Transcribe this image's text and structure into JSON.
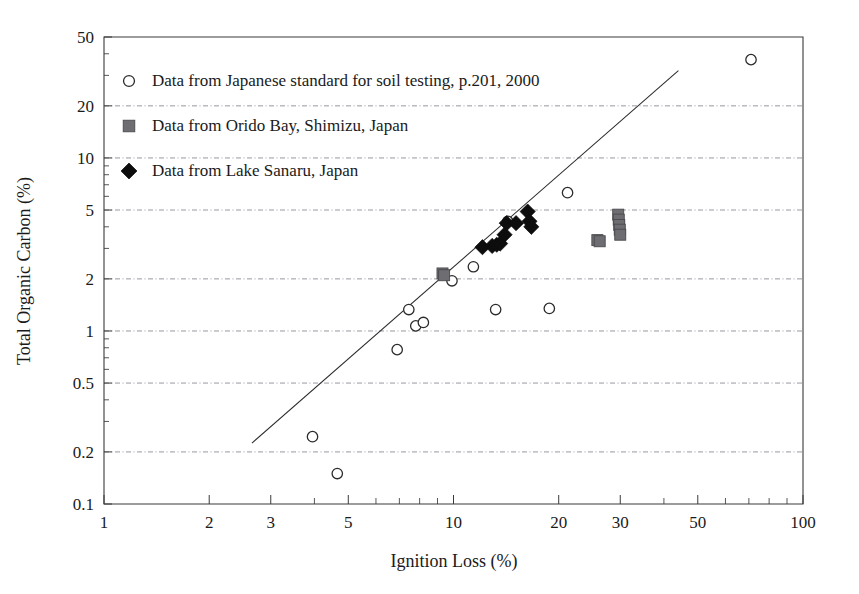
{
  "chart_data": {
    "type": "scatter",
    "title": "",
    "xlabel": "Ignition Loss (%)",
    "ylabel": "Total Organic Carbon (%)",
    "xscale": "log",
    "yscale": "log",
    "xlim": [
      1,
      100
    ],
    "ylim": [
      0.1,
      50
    ],
    "grid": true,
    "grid_axis": "y",
    "legend_position": "upper left",
    "xticks": [
      1,
      2,
      3,
      5,
      10,
      20,
      30,
      50,
      100
    ],
    "xticklabels": [
      "1",
      "2",
      "3",
      "5",
      "10",
      "20",
      "30",
      "50",
      "100"
    ],
    "yticks": [
      0.1,
      0.2,
      0.5,
      1,
      2,
      5,
      10,
      20,
      50
    ],
    "yticklabels": [
      "0.1",
      "0.2",
      "0.5",
      "1",
      "2",
      "5",
      "10",
      "20",
      "50"
    ],
    "series": [
      {
        "name": "Data from Japanese standard for soil testing, p.201, 2000",
        "marker": "open-circle",
        "color": "#ffffff",
        "edge_color": "#2b2b2b",
        "points": [
          {
            "x": 3.95,
            "y": 0.245
          },
          {
            "x": 4.65,
            "y": 0.15
          },
          {
            "x": 6.9,
            "y": 0.78
          },
          {
            "x": 7.8,
            "y": 1.07
          },
          {
            "x": 8.2,
            "y": 1.12
          },
          {
            "x": 7.45,
            "y": 1.33
          },
          {
            "x": 9.9,
            "y": 1.95
          },
          {
            "x": 11.4,
            "y": 2.35
          },
          {
            "x": 13.2,
            "y": 1.33
          },
          {
            "x": 14.3,
            "y": 4.3
          },
          {
            "x": 18.8,
            "y": 1.35
          },
          {
            "x": 21.2,
            "y": 6.3
          },
          {
            "x": 71.0,
            "y": 37.0
          }
        ]
      },
      {
        "name": "Data from Orido Bay, Shimizu, Japan",
        "marker": "filled-square",
        "color": "#6e6e72",
        "edge_color": "#4a4a4e",
        "points": [
          {
            "x": 9.3,
            "y": 2.15
          },
          {
            "x": 9.4,
            "y": 2.1
          },
          {
            "x": 25.8,
            "y": 3.35
          },
          {
            "x": 26.2,
            "y": 3.3
          },
          {
            "x": 29.6,
            "y": 4.7
          },
          {
            "x": 29.7,
            "y": 4.4
          },
          {
            "x": 29.8,
            "y": 4.1
          },
          {
            "x": 29.9,
            "y": 3.85
          },
          {
            "x": 30.0,
            "y": 3.6
          }
        ]
      },
      {
        "name": "Data from Lake Sanaru, Japan",
        "marker": "filled-diamond",
        "color": "#0d0d0d",
        "edge_color": "#0d0d0d",
        "points": [
          {
            "x": 12.1,
            "y": 3.05
          },
          {
            "x": 12.9,
            "y": 3.1
          },
          {
            "x": 13.3,
            "y": 3.15
          },
          {
            "x": 13.6,
            "y": 3.2
          },
          {
            "x": 14.0,
            "y": 3.6
          },
          {
            "x": 14.2,
            "y": 4.2
          },
          {
            "x": 15.1,
            "y": 4.2
          },
          {
            "x": 16.3,
            "y": 4.9
          },
          {
            "x": 16.5,
            "y": 4.3
          },
          {
            "x": 16.7,
            "y": 4.0
          }
        ]
      }
    ],
    "trendline": {
      "label": "",
      "x_start": 2.65,
      "y_start": 0.225,
      "x_end": 44.0,
      "y_end": 32.0
    },
    "annotations": []
  },
  "legend": {
    "items": [
      {
        "marker": "open-circle",
        "label": "Data from Japanese standard for soil testing, p.201, 2000"
      },
      {
        "marker": "filled-square",
        "label": "Data from Orido Bay, Shimizu, Japan"
      },
      {
        "marker": "filled-diamond",
        "label": "Data from Lake Sanaru, Japan"
      }
    ]
  },
  "axes": {
    "x_title": "Ignition Loss (%)",
    "y_title": "Total Organic Carbon (%)"
  }
}
